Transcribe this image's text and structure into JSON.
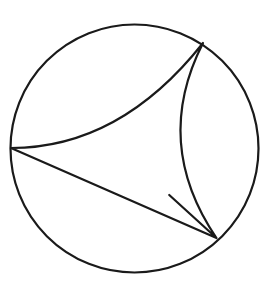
{
  "figure": {
    "title": "Curved triangle inscribed in a circle",
    "background_color": "#ffffff",
    "stroke_color": "#1a1a1a",
    "interior_fill": "#fdfdfd",
    "stroke_width": 2.2,
    "circle": {
      "name": "outer-circle",
      "center_x": 134.5,
      "center_y": 148.5,
      "radius": 124.0
    },
    "cusps": [
      {
        "name": "left-cusp",
        "x": 11.0,
        "y": 148.0
      },
      {
        "name": "upper-right-cusp",
        "x": 203.0,
        "y": 43.0
      },
      {
        "name": "lower-right-cusp",
        "x": 216.5,
        "y": 238.0
      }
    ],
    "arcs": [
      {
        "name": "upper-arc",
        "from": "left-cusp",
        "to": "upper-right-cusp",
        "curvature": "concave-inward",
        "control_x": 120.0,
        "control_y": 148.0
      },
      {
        "name": "lower-arc",
        "from": "left-cusp",
        "to": "lower-right-cusp",
        "curvature": "concave-inward",
        "control_x": 122.0,
        "control_y": 152.0
      },
      {
        "name": "right-arc",
        "from": "upper-right-cusp",
        "to": "lower-right-cusp",
        "curvature": "convex-rightward",
        "control_x": 152.0,
        "control_y": 143.0
      }
    ],
    "paths": {
      "circle_path": "M 134.5 24.5 A 124 124 0 1 1 134.4 24.5 Z",
      "curved_triangle_path": "M 11 148 Q 120 148 203 43 Q 152 143 216.5 238 Q 122 152 11 148 Z"
    }
  }
}
